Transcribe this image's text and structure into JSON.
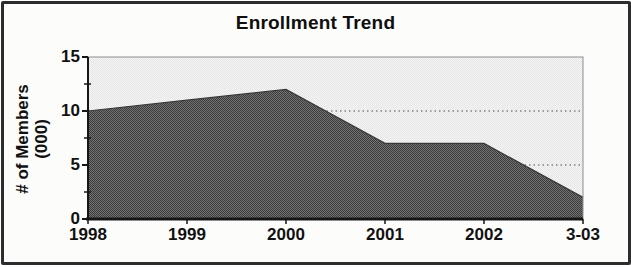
{
  "title": "Enrollment Trend",
  "chart_data": {
    "type": "area",
    "title": "Enrollment Trend",
    "categories": [
      "1998",
      "1999",
      "2000",
      "2001",
      "2002",
      "3-03"
    ],
    "values": [
      10,
      11,
      12,
      7,
      7,
      2
    ],
    "xlabel": "",
    "ylabel": [
      "# of Members",
      "(000)"
    ],
    "ylim": [
      0,
      15
    ],
    "yticks_major": [
      0,
      5,
      10,
      15
    ],
    "yticks_minor": [
      2.5,
      7.5,
      12.5
    ],
    "gridlines_y": [
      5,
      10
    ],
    "grid": "horizontal-dotted",
    "legend": "none",
    "colors": {
      "area_checker_dark": "#3a3a3a",
      "area_checker_light": "#747474",
      "area_edge": "#383838",
      "plot_bg_checker_light": "#f6f6f6",
      "plot_bg_checker_dark": "#e4e4e4",
      "axis": "#161616",
      "gridline": "#4d4d4d",
      "plot_border": "#8d8d8d",
      "frame_border": "#2d2d2d",
      "text": "#111111"
    }
  }
}
